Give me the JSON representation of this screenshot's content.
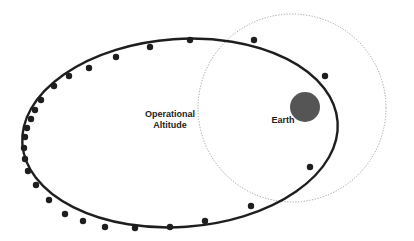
{
  "diagram": {
    "type": "orbit-diagram",
    "labels": {
      "orbit_line1": "Operational",
      "orbit_line2": "Altitude",
      "earth": "Earth"
    },
    "colors": {
      "background": "#ffffff",
      "orbit": "#1e1e1e",
      "earth": "#555555",
      "dotted_circle": "#888888",
      "label": "#222222"
    },
    "orbit": {
      "cx": 180,
      "cy": 133,
      "rx": 158,
      "ry": 94,
      "rotation_deg": -4
    },
    "boundary_circle": {
      "cx": 292,
      "cy": 108,
      "r": 94,
      "style": "dotted"
    },
    "earth": {
      "cx": 305,
      "cy": 107,
      "r": 15
    },
    "marker_points": [
      [
        190,
        40
      ],
      [
        254,
        40
      ],
      [
        325,
        76
      ],
      [
        310,
        167
      ],
      [
        251,
        206
      ],
      [
        205,
        221
      ],
      [
        170,
        227
      ],
      [
        135,
        228
      ],
      [
        105,
        227
      ],
      [
        83,
        221
      ],
      [
        65,
        214
      ],
      [
        49,
        200
      ],
      [
        36,
        185
      ],
      [
        28,
        171
      ],
      [
        25,
        159
      ],
      [
        24,
        148
      ],
      [
        25,
        137
      ],
      [
        27,
        128
      ],
      [
        31,
        119
      ],
      [
        35,
        110
      ],
      [
        41,
        100
      ],
      [
        54,
        86
      ],
      [
        69,
        76
      ],
      [
        89,
        68
      ],
      [
        116,
        57
      ],
      [
        150,
        47
      ]
    ]
  }
}
